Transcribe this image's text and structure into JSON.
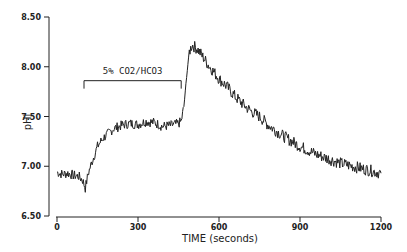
{
  "chart_data": {
    "type": "line",
    "title": "",
    "xlabel": "TIME (seconds)",
    "ylabel": "pHi",
    "xlim": [
      0,
      1200
    ],
    "ylim": [
      6.5,
      8.5
    ],
    "x_ticks": [
      0,
      300,
      600,
      900,
      1200
    ],
    "x_tick_labels": [
      "0",
      "300",
      "600",
      "900",
      "1200"
    ],
    "y_ticks": [
      6.5,
      7.0,
      7.5,
      8.0,
      8.5
    ],
    "y_tick_labels": [
      "6.50",
      "7.00",
      "7.50",
      "8.00",
      "8.50"
    ],
    "grid": false,
    "legend": null,
    "annotations": [
      {
        "text": "5% CO2/HCO3",
        "type": "bracket",
        "x_start": 100,
        "x_end": 460,
        "y": 7.86,
        "y_tick_end": 7.78
      }
    ],
    "series": [
      {
        "name": "pHi",
        "color": "#222222",
        "x": [
          0,
          20,
          40,
          60,
          80,
          95,
          105,
          115,
          130,
          150,
          170,
          190,
          210,
          230,
          250,
          270,
          300,
          330,
          360,
          390,
          420,
          450,
          460,
          470,
          480,
          490,
          500,
          520,
          540,
          560,
          580,
          600,
          630,
          660,
          690,
          720,
          750,
          780,
          810,
          840,
          870,
          900,
          930,
          960,
          990,
          1020,
          1050,
          1080,
          1110,
          1140,
          1170,
          1200
        ],
        "y": [
          6.94,
          6.92,
          6.93,
          6.91,
          6.9,
          6.86,
          6.78,
          6.92,
          7.05,
          7.2,
          7.28,
          7.33,
          7.38,
          7.4,
          7.42,
          7.43,
          7.42,
          7.45,
          7.44,
          7.4,
          7.41,
          7.43,
          7.45,
          7.6,
          7.9,
          8.15,
          8.22,
          8.18,
          8.1,
          8.02,
          7.95,
          7.88,
          7.8,
          7.7,
          7.62,
          7.55,
          7.5,
          7.42,
          7.36,
          7.3,
          7.25,
          7.2,
          7.16,
          7.12,
          7.09,
          7.06,
          7.03,
          7.01,
          6.99,
          6.97,
          6.95,
          6.93
        ]
      }
    ]
  }
}
